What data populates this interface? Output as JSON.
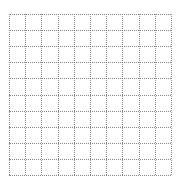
{
  "grid": {
    "columns": 10,
    "rows": 10,
    "line_style": "dotted",
    "line_color": "#8a8a8a",
    "background_color": "#ffffff"
  }
}
